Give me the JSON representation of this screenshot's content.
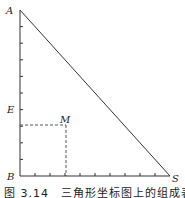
{
  "diagram": {
    "type": "right-triangle-composition-diagram",
    "vertices": [
      {
        "name": "A",
        "label": "A",
        "x": 20,
        "y": 10
      },
      {
        "name": "B",
        "label": "B",
        "x": 20,
        "y": 176
      },
      {
        "name": "S",
        "label": "S",
        "x": 170,
        "y": 176
      }
    ],
    "points": [
      {
        "name": "E",
        "label": "E",
        "x": 20,
        "y": 109
      },
      {
        "name": "M",
        "label": "M",
        "x": 66,
        "y": 125
      }
    ],
    "vertical_ticks": 10,
    "horizontal_ticks": 10,
    "colors": {
      "line": "#333333",
      "dashed": "#555555"
    }
  },
  "labels": {
    "A": "A",
    "B": "B",
    "S": "S",
    "E": "E",
    "M": "M"
  },
  "caption": "图 3.14　三角形坐标图上的组成表示"
}
